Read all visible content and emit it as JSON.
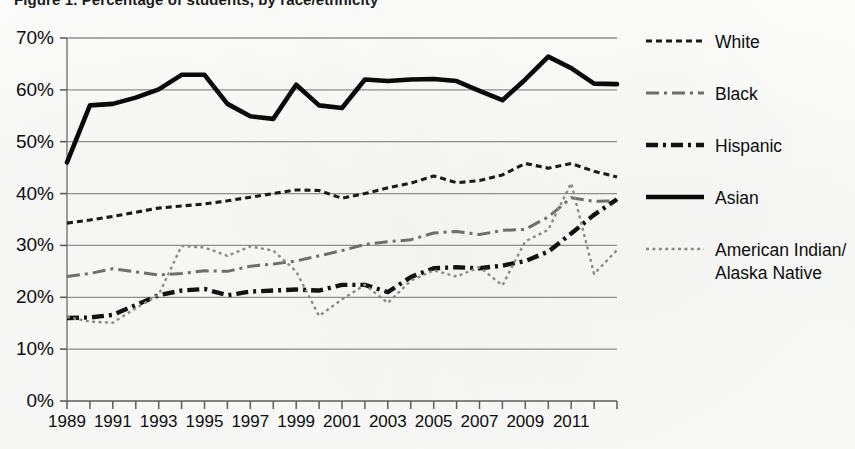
{
  "figure": {
    "title": "Figure 1. Percentage of students, by race/ethnicity"
  },
  "chart_data": {
    "type": "line",
    "title": "",
    "xlabel": "",
    "ylabel": "",
    "xlim": [
      1989,
      2013
    ],
    "ylim": [
      0,
      70
    ],
    "grid": true,
    "legend_position": "right",
    "y_ticks": [
      "0%",
      "10%",
      "20%",
      "30%",
      "40%",
      "50%",
      "60%",
      "70%"
    ],
    "y_tick_values": [
      0,
      10,
      20,
      30,
      40,
      50,
      60,
      70
    ],
    "x_ticks": [
      "1989",
      "1991",
      "1993",
      "1995",
      "1997",
      "1999",
      "2001",
      "2003",
      "2005",
      "2007",
      "2009",
      "2011"
    ],
    "x_tick_values": [
      1989,
      1991,
      1993,
      1995,
      1997,
      1999,
      2001,
      2003,
      2005,
      2007,
      2009,
      2011
    ],
    "x_minor_ticks": [
      1990,
      1992,
      1994,
      1996,
      1998,
      2000,
      2002,
      2004,
      2006,
      2008,
      2010,
      2012,
      2013
    ],
    "x": [
      1989,
      1990,
      1991,
      1992,
      1993,
      1994,
      1995,
      1996,
      1997,
      1998,
      1999,
      2000,
      2001,
      2002,
      2003,
      2004,
      2005,
      2006,
      2007,
      2008,
      2009,
      2010,
      2011,
      2012,
      2013
    ],
    "series": [
      {
        "name": "White",
        "style": "dashed",
        "color": "#1a1a1a",
        "width": 3.1,
        "dash": "6,4",
        "values": [
          34.3,
          34.9,
          35.6,
          36.4,
          37.2,
          37.6,
          38.0,
          38.6,
          39.3,
          40.0,
          40.7,
          40.6,
          39.1,
          40.0,
          41.1,
          42.0,
          43.4,
          42.1,
          42.5,
          43.6,
          45.8,
          44.9,
          45.8,
          44.3,
          43.2
        ]
      },
      {
        "name": "Black",
        "style": "dash-dot-dash",
        "color": "#6e6e6e",
        "width": 3.0,
        "dash": "13,5,3,5",
        "values": [
          24.0,
          24.6,
          25.5,
          24.9,
          24.3,
          24.6,
          25.1,
          25.0,
          26.0,
          26.4,
          27.0,
          28.0,
          29.0,
          30.2,
          30.7,
          31.1,
          32.4,
          32.7,
          32.1,
          32.9,
          33.1,
          35.5,
          39.2,
          38.5,
          38.6
        ]
      },
      {
        "name": "Hispanic",
        "style": "dash-dot",
        "color": "#121212",
        "width": 4.4,
        "dash": "12,5,3,5",
        "values": [
          16.0,
          16.1,
          16.6,
          18.5,
          20.4,
          21.3,
          21.6,
          20.4,
          21.1,
          21.3,
          21.5,
          21.3,
          22.4,
          22.4,
          21.0,
          23.9,
          25.6,
          25.8,
          25.6,
          26.1,
          27.0,
          28.8,
          32.3,
          35.9,
          38.9
        ]
      },
      {
        "name": "Asian",
        "style": "solid",
        "color": "#0a0a0a",
        "width": 4.6,
        "dash": "",
        "values": [
          46.0,
          57.0,
          57.3,
          58.5,
          60.1,
          62.9,
          62.9,
          57.3,
          54.9,
          54.4,
          61.0,
          57.0,
          56.5,
          62.0,
          61.7,
          62.0,
          62.1,
          61.7,
          59.8,
          58.0,
          62.0,
          66.4,
          64.2,
          61.2,
          61.1
        ]
      },
      {
        "name": "American Indian/\nAlaska Native",
        "label_lines": [
          "American Indian/",
          "Alaska Native"
        ],
        "style": "dotted",
        "color": "#8a8a8a",
        "width": 2.4,
        "dash": "3,3.4",
        "values": [
          16.2,
          15.3,
          15.1,
          17.9,
          20.5,
          29.9,
          29.6,
          28.0,
          29.8,
          29.0,
          25.0,
          16.4,
          19.6,
          22.4,
          18.9,
          23.2,
          25.2,
          24.0,
          25.8,
          22.3,
          30.8,
          33.0,
          42.0,
          24.5,
          29.1
        ]
      }
    ]
  }
}
